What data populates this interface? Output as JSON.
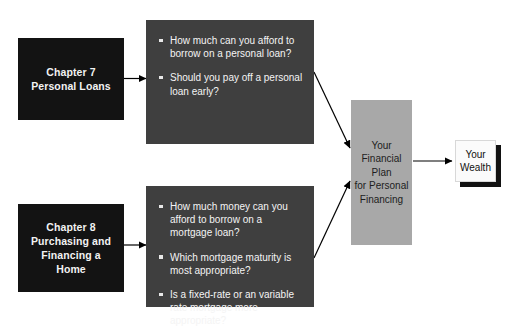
{
  "diagram": {
    "title_hidden": "",
    "colors": {
      "chapter_fill": "#131313",
      "question_fill": "#3f3f3f",
      "plan_fill": "#a8a8a8",
      "wealth_fill": "#fbfbfb",
      "arrow": "#000000",
      "background": "#ffffff"
    },
    "chapter7": {
      "line1": "Chapter 7",
      "line2": "Personal Loans"
    },
    "chapter8": {
      "line1": "Chapter 8",
      "line2": "Purchasing and",
      "line3": "Financing a",
      "line4": "Home"
    },
    "questions_top": [
      "How much can you  afford to borrow on a personal loan?",
      "Should you pay off a personal loan early?"
    ],
    "questions_bottom": [
      "How much money can you afford to borrow on a mortgage loan?",
      "Which mortgage maturity is most appropriate?",
      "Is a fixed-rate or an variable rate mortgage more appropriate?"
    ],
    "plan": {
      "line1": "Your",
      "line2": "Financial Plan",
      "line3": "for Personal",
      "line4": "Financing"
    },
    "wealth": {
      "line1": "Your",
      "line2": "Wealth"
    }
  }
}
